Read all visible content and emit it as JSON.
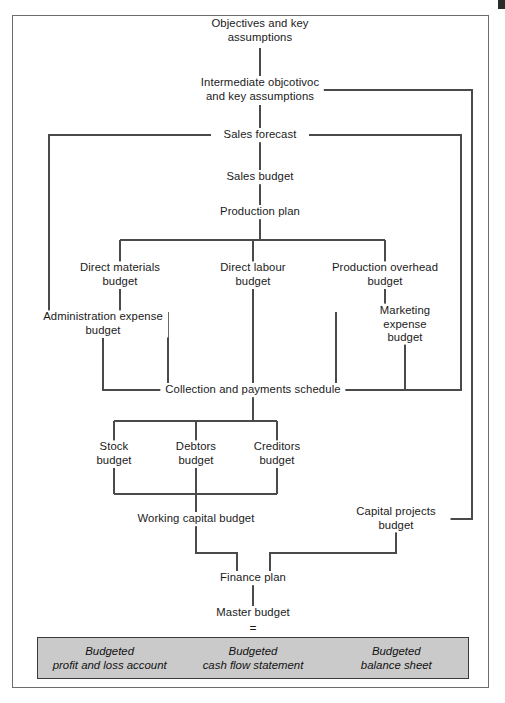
{
  "diagram": {
    "frame": {
      "border_color": "#6d6d6d"
    },
    "summary_box": {
      "fill_color": "#cacaca",
      "border_color": "#3a3a3a"
    },
    "equals_sign": "=",
    "nodes": [
      {
        "id": "objectives",
        "label": "Objectives and key\nassumptions",
        "x": 260,
        "y": 31
      },
      {
        "id": "intermediate",
        "label": "Intermediate objcotivoc\nand key assumptions",
        "x": 260,
        "y": 90
      },
      {
        "id": "sales-forecast",
        "label": "Sales forecast",
        "x": 260,
        "y": 135
      },
      {
        "id": "sales-budget",
        "label": "Sales budget",
        "x": 260,
        "y": 177
      },
      {
        "id": "production-plan",
        "label": "Production plan",
        "x": 260,
        "y": 212
      },
      {
        "id": "direct-materials",
        "label": "Direct materials\nbudget",
        "x": 120,
        "y": 275
      },
      {
        "id": "direct-labour",
        "label": "Direct labour\nbudget",
        "x": 253,
        "y": 275
      },
      {
        "id": "production-oh",
        "label": "Production overhead\nbudget",
        "x": 385,
        "y": 275
      },
      {
        "id": "admin-expense",
        "label": "Administration expense\nbudget",
        "x": 103,
        "y": 324
      },
      {
        "id": "marketing-expense",
        "label": "Marketing expense\nbudget",
        "x": 405,
        "y": 324
      },
      {
        "id": "collection",
        "label": "Collection and payments schedule",
        "x": 253,
        "y": 390
      },
      {
        "id": "stock",
        "label": "Stock\nbudget",
        "x": 114,
        "y": 454
      },
      {
        "id": "debtors",
        "label": "Debtors\nbudget",
        "x": 196,
        "y": 454
      },
      {
        "id": "creditors",
        "label": "Creditors\nbudget",
        "x": 277,
        "y": 454
      },
      {
        "id": "working-capital",
        "label": "Working capital budget",
        "x": 196,
        "y": 519
      },
      {
        "id": "capital-projects",
        "label": "Capital projects budget",
        "x": 396,
        "y": 519
      },
      {
        "id": "finance-plan",
        "label": "Finance plan",
        "x": 253,
        "y": 578
      },
      {
        "id": "master-budget",
        "label": "Master budget",
        "x": 253,
        "y": 613
      }
    ],
    "summary_items": [
      {
        "id": "budgeted-pl",
        "label": "Budgeted\nprofit and loss account"
      },
      {
        "id": "budgeted-cashflow",
        "label": "Budgeted\ncash flow statement"
      },
      {
        "id": "budgeted-balance",
        "label": "Budgeted\nbalance sheet"
      }
    ]
  }
}
